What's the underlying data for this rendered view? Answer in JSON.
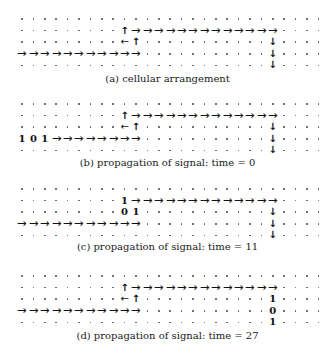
{
  "grid": {
    "columns": 27,
    "rows_per_panel": 5,
    "col_x0": 22,
    "col_step": 11.4,
    "row_step": 11.6
  },
  "symbols": {
    "right": "→",
    "left": "←",
    "up": "↑",
    "down": "↓"
  },
  "panels": [
    {
      "id": "a",
      "caption": "(a) cellular arrangement",
      "row_y0": 19,
      "caption_y": 80,
      "cells": [
        {
          "r": 1,
          "c": 9,
          "t": "up"
        },
        {
          "r": 1,
          "c": 10,
          "t": "right"
        },
        {
          "r": 1,
          "c": 11,
          "t": "right"
        },
        {
          "r": 1,
          "c": 12,
          "t": "right"
        },
        {
          "r": 1,
          "c": 13,
          "t": "right"
        },
        {
          "r": 1,
          "c": 14,
          "t": "right"
        },
        {
          "r": 1,
          "c": 15,
          "t": "right"
        },
        {
          "r": 1,
          "c": 16,
          "t": "right"
        },
        {
          "r": 1,
          "c": 17,
          "t": "right"
        },
        {
          "r": 1,
          "c": 18,
          "t": "right"
        },
        {
          "r": 1,
          "c": 19,
          "t": "right"
        },
        {
          "r": 1,
          "c": 20,
          "t": "right"
        },
        {
          "r": 1,
          "c": 21,
          "t": "right"
        },
        {
          "r": 1,
          "c": 22,
          "t": "right"
        },
        {
          "r": 2,
          "c": 9,
          "t": "left"
        },
        {
          "r": 2,
          "c": 10,
          "t": "up"
        },
        {
          "r": 2,
          "c": 22,
          "t": "down"
        },
        {
          "r": 3,
          "c": 0,
          "t": "right"
        },
        {
          "r": 3,
          "c": 1,
          "t": "right"
        },
        {
          "r": 3,
          "c": 2,
          "t": "right"
        },
        {
          "r": 3,
          "c": 3,
          "t": "right"
        },
        {
          "r": 3,
          "c": 4,
          "t": "right"
        },
        {
          "r": 3,
          "c": 5,
          "t": "right"
        },
        {
          "r": 3,
          "c": 6,
          "t": "right"
        },
        {
          "r": 3,
          "c": 7,
          "t": "right"
        },
        {
          "r": 3,
          "c": 8,
          "t": "right"
        },
        {
          "r": 3,
          "c": 9,
          "t": "right"
        },
        {
          "r": 3,
          "c": 10,
          "t": "right"
        },
        {
          "r": 3,
          "c": 22,
          "t": "down"
        },
        {
          "r": 4,
          "c": 22,
          "t": "down"
        }
      ]
    },
    {
      "id": "b",
      "caption": "(b) propagation of signal: time = 0",
      "row_y0": 104,
      "caption_y": 164,
      "cells": [
        {
          "r": 1,
          "c": 9,
          "t": "up"
        },
        {
          "r": 1,
          "c": 10,
          "t": "right"
        },
        {
          "r": 1,
          "c": 11,
          "t": "right"
        },
        {
          "r": 1,
          "c": 12,
          "t": "right"
        },
        {
          "r": 1,
          "c": 13,
          "t": "right"
        },
        {
          "r": 1,
          "c": 14,
          "t": "right"
        },
        {
          "r": 1,
          "c": 15,
          "t": "right"
        },
        {
          "r": 1,
          "c": 16,
          "t": "right"
        },
        {
          "r": 1,
          "c": 17,
          "t": "right"
        },
        {
          "r": 1,
          "c": 18,
          "t": "right"
        },
        {
          "r": 1,
          "c": 19,
          "t": "right"
        },
        {
          "r": 1,
          "c": 20,
          "t": "right"
        },
        {
          "r": 1,
          "c": 21,
          "t": "right"
        },
        {
          "r": 1,
          "c": 22,
          "t": "right"
        },
        {
          "r": 2,
          "c": 9,
          "t": "left"
        },
        {
          "r": 2,
          "c": 10,
          "t": "up"
        },
        {
          "r": 2,
          "c": 22,
          "t": "down"
        },
        {
          "r": 3,
          "c": 0,
          "t": "digit",
          "v": "1"
        },
        {
          "r": 3,
          "c": 1,
          "t": "digit",
          "v": "0"
        },
        {
          "r": 3,
          "c": 2,
          "t": "digit",
          "v": "1"
        },
        {
          "r": 3,
          "c": 3,
          "t": "right"
        },
        {
          "r": 3,
          "c": 4,
          "t": "right"
        },
        {
          "r": 3,
          "c": 5,
          "t": "right"
        },
        {
          "r": 3,
          "c": 6,
          "t": "right"
        },
        {
          "r": 3,
          "c": 7,
          "t": "right"
        },
        {
          "r": 3,
          "c": 8,
          "t": "right"
        },
        {
          "r": 3,
          "c": 9,
          "t": "right"
        },
        {
          "r": 3,
          "c": 10,
          "t": "right"
        },
        {
          "r": 3,
          "c": 22,
          "t": "down"
        },
        {
          "r": 4,
          "c": 22,
          "t": "down"
        }
      ]
    },
    {
      "id": "c",
      "caption": "(c) propagation of signal: time = 11",
      "row_y0": 189,
      "caption_y": 248,
      "cells": [
        {
          "r": 1,
          "c": 9,
          "t": "digit",
          "v": "1"
        },
        {
          "r": 1,
          "c": 10,
          "t": "right"
        },
        {
          "r": 1,
          "c": 11,
          "t": "right"
        },
        {
          "r": 1,
          "c": 12,
          "t": "right"
        },
        {
          "r": 1,
          "c": 13,
          "t": "right"
        },
        {
          "r": 1,
          "c": 14,
          "t": "right"
        },
        {
          "r": 1,
          "c": 15,
          "t": "right"
        },
        {
          "r": 1,
          "c": 16,
          "t": "right"
        },
        {
          "r": 1,
          "c": 17,
          "t": "right"
        },
        {
          "r": 1,
          "c": 18,
          "t": "right"
        },
        {
          "r": 1,
          "c": 19,
          "t": "right"
        },
        {
          "r": 1,
          "c": 20,
          "t": "right"
        },
        {
          "r": 1,
          "c": 21,
          "t": "right"
        },
        {
          "r": 1,
          "c": 22,
          "t": "right"
        },
        {
          "r": 2,
          "c": 9,
          "t": "digit",
          "v": "0"
        },
        {
          "r": 2,
          "c": 10,
          "t": "digit",
          "v": "1"
        },
        {
          "r": 2,
          "c": 22,
          "t": "down"
        },
        {
          "r": 3,
          "c": 0,
          "t": "right"
        },
        {
          "r": 3,
          "c": 1,
          "t": "right"
        },
        {
          "r": 3,
          "c": 2,
          "t": "right"
        },
        {
          "r": 3,
          "c": 3,
          "t": "right"
        },
        {
          "r": 3,
          "c": 4,
          "t": "right"
        },
        {
          "r": 3,
          "c": 5,
          "t": "right"
        },
        {
          "r": 3,
          "c": 6,
          "t": "right"
        },
        {
          "r": 3,
          "c": 7,
          "t": "right"
        },
        {
          "r": 3,
          "c": 8,
          "t": "right"
        },
        {
          "r": 3,
          "c": 9,
          "t": "right"
        },
        {
          "r": 3,
          "c": 10,
          "t": "right"
        },
        {
          "r": 3,
          "c": 22,
          "t": "down"
        },
        {
          "r": 4,
          "c": 22,
          "t": "down"
        }
      ]
    },
    {
      "id": "d",
      "caption": "(d) propagation of signal: time = 27",
      "row_y0": 276,
      "caption_y": 337,
      "cells": [
        {
          "r": 1,
          "c": 9,
          "t": "up"
        },
        {
          "r": 1,
          "c": 10,
          "t": "right"
        },
        {
          "r": 1,
          "c": 11,
          "t": "right"
        },
        {
          "r": 1,
          "c": 12,
          "t": "right"
        },
        {
          "r": 1,
          "c": 13,
          "t": "right"
        },
        {
          "r": 1,
          "c": 14,
          "t": "right"
        },
        {
          "r": 1,
          "c": 15,
          "t": "right"
        },
        {
          "r": 1,
          "c": 16,
          "t": "right"
        },
        {
          "r": 1,
          "c": 17,
          "t": "right"
        },
        {
          "r": 1,
          "c": 18,
          "t": "right"
        },
        {
          "r": 1,
          "c": 19,
          "t": "right"
        },
        {
          "r": 1,
          "c": 20,
          "t": "right"
        },
        {
          "r": 1,
          "c": 21,
          "t": "right"
        },
        {
          "r": 1,
          "c": 22,
          "t": "right"
        },
        {
          "r": 2,
          "c": 9,
          "t": "left"
        },
        {
          "r": 2,
          "c": 10,
          "t": "up"
        },
        {
          "r": 2,
          "c": 22,
          "t": "digit",
          "v": "1"
        },
        {
          "r": 3,
          "c": 0,
          "t": "right"
        },
        {
          "r": 3,
          "c": 1,
          "t": "right"
        },
        {
          "r": 3,
          "c": 2,
          "t": "right"
        },
        {
          "r": 3,
          "c": 3,
          "t": "right"
        },
        {
          "r": 3,
          "c": 4,
          "t": "right"
        },
        {
          "r": 3,
          "c": 5,
          "t": "right"
        },
        {
          "r": 3,
          "c": 6,
          "t": "right"
        },
        {
          "r": 3,
          "c": 7,
          "t": "right"
        },
        {
          "r": 3,
          "c": 8,
          "t": "right"
        },
        {
          "r": 3,
          "c": 9,
          "t": "right"
        },
        {
          "r": 3,
          "c": 10,
          "t": "right"
        },
        {
          "r": 3,
          "c": 22,
          "t": "digit",
          "v": "0"
        },
        {
          "r": 4,
          "c": 22,
          "t": "digit",
          "v": "1"
        }
      ]
    }
  ]
}
